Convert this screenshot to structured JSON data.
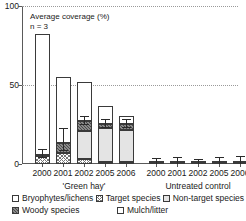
{
  "annotations": {
    "title": "Average coverage (%)",
    "sample_note": "n = 3"
  },
  "axis": {
    "y_ticks": [
      "0",
      "50",
      "100"
    ],
    "y_values": [
      0,
      50,
      100
    ],
    "y_min": 0,
    "y_max": 100
  },
  "groups": [
    {
      "label": "'Green hay'",
      "categories": [
        "2000",
        "2001",
        "2002",
        "2005",
        "2006"
      ]
    },
    {
      "label": "Untreated control",
      "categories": [
        "2000",
        "2001",
        "2002",
        "2005",
        "2006"
      ]
    }
  ],
  "legend": [
    {
      "label": "Bryophytes/lichens",
      "pattern": "open-white"
    },
    {
      "label": "Target species",
      "pattern": "cross-hatch"
    },
    {
      "label": "Non-target species",
      "pattern": "light-grey"
    },
    {
      "label": "Woody species",
      "pattern": "dark-diagonal"
    },
    {
      "label": "Mulch/litter",
      "pattern": "open-white"
    }
  ],
  "chart_data": {
    "type": "bar",
    "title": "Average coverage (%)",
    "subtitle": "n = 3",
    "xlabel": "",
    "ylabel": "Average coverage (%)",
    "ylim": [
      0,
      100
    ],
    "yticks": [
      0,
      50,
      100
    ],
    "grid": "horizontal-dotted",
    "legend_position": "bottom",
    "stacked": true,
    "categories": [
      "2000",
      "2001",
      "2002",
      "2005",
      "2006"
    ],
    "groups": [
      "'Green hay'",
      "Untreated control"
    ],
    "series": [
      {
        "name": "Target species",
        "pattern": "cross-hatch",
        "green_hay": [
          5,
          7,
          3,
          1.5,
          1.5
        ],
        "untreated_control": [
          0.4,
          0.4,
          0.4,
          0.4,
          0.4
        ]
      },
      {
        "name": "Non-target species",
        "pattern": "light-grey",
        "green_hay": [
          0,
          0,
          18,
          21,
          20
        ],
        "untreated_control": [
          0.4,
          0.4,
          0.4,
          0.6,
          0.8
        ]
      },
      {
        "name": "Woody species",
        "pattern": "dark-diagonal",
        "green_hay": [
          1,
          6,
          6,
          3,
          4
        ],
        "untreated_control": [
          0,
          0,
          0,
          0,
          0
        ]
      },
      {
        "name": "Bryophytes/lichens",
        "pattern": "open-white",
        "green_hay": [
          76,
          42,
          25,
          11,
          5
        ],
        "untreated_control": [
          0,
          0,
          0,
          0,
          0
        ]
      }
    ],
    "totals": {
      "green_hay": [
        82,
        55,
        52,
        36.5,
        30.5
      ],
      "untreated_control": [
        0.8,
        0.8,
        0.8,
        1.0,
        1.2
      ]
    },
    "error_bars": {
      "green_hay": [
        {
          "at": 6,
          "low": 3.5,
          "high": 9
        },
        {
          "at": 13,
          "low": 8,
          "high": 22
        },
        {
          "at": 27,
          "low": 25,
          "high": 30
        },
        {
          "at": 25,
          "low": 23,
          "high": 28
        },
        {
          "at": 25,
          "low": 23,
          "high": 28
        }
      ],
      "untreated_control": [
        {
          "at": 0.8,
          "low": 0,
          "high": 3
        },
        {
          "at": 0.8,
          "low": 0,
          "high": 3.5
        },
        {
          "at": 0.8,
          "low": 0,
          "high": 2.5
        },
        {
          "at": 1.0,
          "low": 0,
          "high": 4
        },
        {
          "at": 1.2,
          "low": 0,
          "high": 4.5
        }
      ]
    }
  }
}
